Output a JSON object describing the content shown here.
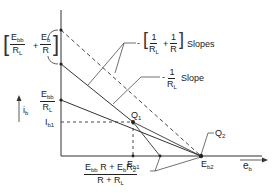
{
  "diagram": {
    "axes": {
      "y_label": "i",
      "y_label_sub": "b",
      "x_label": "e",
      "x_label_sub": "b"
    },
    "labels": {
      "intercept_top": {
        "num1": "E",
        "num1_sub": "bb",
        "den1": "R",
        "den1_sub": "L",
        "plus": "+",
        "num2": "E",
        "num2_sub": "b",
        "den2": "R"
      },
      "intercept_mid": {
        "num": "E",
        "num_sub": "bb",
        "den": "R",
        "den_sub": "L"
      },
      "ib1": {
        "text": "I",
        "sub": "b1"
      },
      "slopes": {
        "minus": "-",
        "num1": "1",
        "den1": "R",
        "den1_sub": "L",
        "plus": "+",
        "num2": "1",
        "den2": "R",
        "suffix": "Slopes"
      },
      "slope": {
        "minus": "-",
        "num": "1",
        "den": "R",
        "den_sub": "L",
        "suffix": "Slope"
      },
      "q1": {
        "text": "Q",
        "sub": "1"
      },
      "q2": {
        "text": "Q",
        "sub": "2"
      },
      "eb1": {
        "text": "E",
        "sub": "b1"
      },
      "eb2": {
        "text": "E",
        "sub": "b2"
      },
      "bottom_fraction": {
        "num_a": "E",
        "num_a_sub": "bb",
        "num_b": " R + E",
        "num_b_sub": "b",
        "num_c": "R",
        "num_c_sub": "2",
        "den_a": "R + R",
        "den_a_sub": "L"
      }
    },
    "colors": {
      "ink": "#222222",
      "background": "#ffffff"
    }
  }
}
